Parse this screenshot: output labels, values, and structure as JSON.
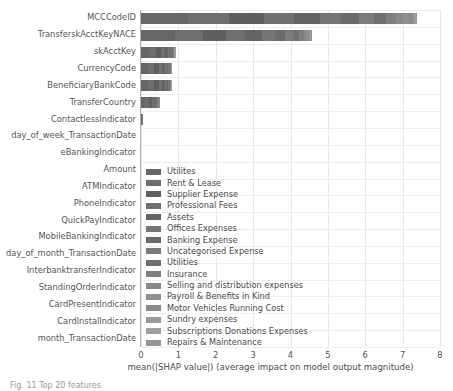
{
  "chart_data": {
    "type": "bar",
    "orientation": "horizontal",
    "stacked": true,
    "title": "",
    "xlabel": "mean(|SHAP value|) (average impact on model output magnitude)",
    "ylabel": "",
    "xlim": [
      0,
      8
    ],
    "xticks": [
      "0",
      "1",
      "2",
      "3",
      "4",
      "5",
      "6",
      "7",
      "8"
    ],
    "grid": true,
    "legend_position": "center-left-inside",
    "categories": [
      "MCCCodeID",
      "TransferskAcctKeyNACE",
      "skAcctKey",
      "CurrencyCode",
      "BeneficiaryBankCode",
      "TransferCountry",
      "ContactlessIndicator",
      "day_of_week_TransactionDate",
      "eBankingIndicator",
      "Amount",
      "ATMIndicator",
      "PhoneIndicator",
      "QuickPayIndicator",
      "MobileBankingIndicator",
      "day_of_month_TransactionDate",
      "InterbanktransferIndicator",
      "StandingOrderIndicator",
      "CardPresentIndicator",
      "CardInstalIndicator",
      "month_TransactionDate"
    ],
    "totals": [
      7.36,
      4.45,
      0.9,
      0.8,
      0.78,
      0.5,
      0.04,
      0.0,
      0.0,
      0.0,
      0.0,
      0.0,
      0.0,
      0.0,
      0.0,
      0.0,
      0.0,
      0.0,
      0.0,
      0.0
    ],
    "series": [
      {
        "name": "Utilites",
        "color": "#666666",
        "values": [
          1.25,
          0.9,
          0.22,
          0.2,
          0.19,
          0.12,
          0.01,
          0,
          0,
          0,
          0,
          0,
          0,
          0,
          0,
          0,
          0,
          0,
          0,
          0
        ]
      },
      {
        "name": "Rent & Lease",
        "color": "#6e6e6e",
        "values": [
          1.1,
          0.75,
          0.18,
          0.16,
          0.16,
          0.1,
          0.01,
          0,
          0,
          0,
          0,
          0,
          0,
          0,
          0,
          0,
          0,
          0,
          0,
          0
        ]
      },
      {
        "name": "Supplier Expense",
        "color": "#5f5f5f",
        "values": [
          0.95,
          0.62,
          0.13,
          0.12,
          0.12,
          0.07,
          0.01,
          0,
          0,
          0,
          0,
          0,
          0,
          0,
          0,
          0,
          0,
          0,
          0,
          0
        ]
      },
      {
        "name": "Professional Fees",
        "color": "#707070",
        "values": [
          0.8,
          0.52,
          0.1,
          0.09,
          0.09,
          0.05,
          0.005,
          0,
          0,
          0,
          0,
          0,
          0,
          0,
          0,
          0,
          0,
          0,
          0,
          0
        ]
      },
      {
        "name": "Assets",
        "color": "#646464",
        "values": [
          0.68,
          0.44,
          0.08,
          0.07,
          0.07,
          0.04,
          0.004,
          0,
          0,
          0,
          0,
          0,
          0,
          0,
          0,
          0,
          0,
          0,
          0,
          0
        ]
      },
      {
        "name": "Offices Expenses",
        "color": "#757575",
        "values": [
          0.58,
          0.35,
          0.06,
          0.05,
          0.05,
          0.03,
          0.003,
          0,
          0,
          0,
          0,
          0,
          0,
          0,
          0,
          0,
          0,
          0,
          0,
          0
        ]
      },
      {
        "name": "Banking Expense",
        "color": "#6a6a6a",
        "values": [
          0.48,
          0.28,
          0.04,
          0.04,
          0.04,
          0.02,
          0.002,
          0,
          0,
          0,
          0,
          0,
          0,
          0,
          0,
          0,
          0,
          0,
          0,
          0
        ]
      },
      {
        "name": "Uncategorised Expense",
        "color": "#7b7b7b",
        "values": [
          0.4,
          0.22,
          0.03,
          0.03,
          0.03,
          0.02,
          0.001,
          0,
          0,
          0,
          0,
          0,
          0,
          0,
          0,
          0,
          0,
          0,
          0,
          0
        ]
      },
      {
        "name": "Utilities",
        "color": "#6f6f6f",
        "values": [
          0.32,
          0.16,
          0.02,
          0.02,
          0.02,
          0.012,
          0.001,
          0,
          0,
          0,
          0,
          0,
          0,
          0,
          0,
          0,
          0,
          0,
          0,
          0
        ]
      },
      {
        "name": "Insurance",
        "color": "#7f7f7f",
        "values": [
          0.26,
          0.11,
          0.015,
          0.012,
          0.012,
          0.008,
          0.001,
          0,
          0,
          0,
          0,
          0,
          0,
          0,
          0,
          0,
          0,
          0,
          0,
          0
        ]
      },
      {
        "name": "Selling and distribution expenses",
        "color": "#888888",
        "values": [
          0.2,
          0.07,
          0.01,
          0.008,
          0.008,
          0.005,
          0,
          0,
          0,
          0,
          0,
          0,
          0,
          0,
          0,
          0,
          0,
          0,
          0,
          0
        ]
      },
      {
        "name": "Payroll & Benefits in Kind",
        "color": "#909090",
        "values": [
          0.15,
          0.05,
          0.008,
          0.006,
          0.006,
          0.004,
          0,
          0,
          0,
          0,
          0,
          0,
          0,
          0,
          0,
          0,
          0,
          0,
          0,
          0
        ]
      },
      {
        "name": "Motor Vehicles Running Cost",
        "color": "#8a8a8a",
        "values": [
          0.11,
          0.03,
          0.006,
          0.005,
          0.005,
          0.003,
          0,
          0,
          0,
          0,
          0,
          0,
          0,
          0,
          0,
          0,
          0,
          0,
          0,
          0
        ]
      },
      {
        "name": "Sundry expenses",
        "color": "#999999",
        "values": [
          0.05,
          0.02,
          0.004,
          0.004,
          0.004,
          0.002,
          0,
          0,
          0,
          0,
          0,
          0,
          0,
          0,
          0,
          0,
          0,
          0,
          0,
          0
        ]
      },
      {
        "name": "Subscriptions Donations Expenses",
        "color": "#a0a0a0",
        "values": [
          0.02,
          0.02,
          0.003,
          0.003,
          0.003,
          0.002,
          0,
          0,
          0,
          0,
          0,
          0,
          0,
          0,
          0,
          0,
          0,
          0,
          0,
          0
        ]
      },
      {
        "name": "Repairs & Maintenance",
        "color": "#959595",
        "values": [
          0.01,
          0.01,
          0.002,
          0.002,
          0.002,
          0.001,
          0,
          0,
          0,
          0,
          0,
          0,
          0,
          0,
          0,
          0,
          0,
          0,
          0,
          0
        ]
      }
    ]
  },
  "caption": "Fig. 11 Top 20 features"
}
